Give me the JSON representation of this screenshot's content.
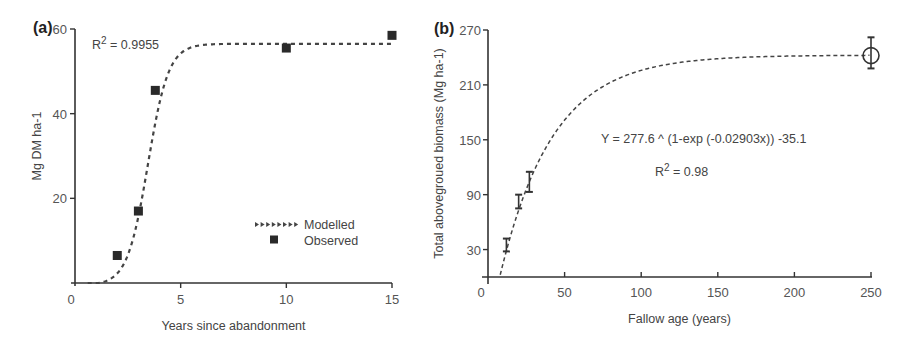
{
  "chart_data": [
    {
      "panel": "(a)",
      "type": "scatter",
      "title": "",
      "xlabel": "Years since abandonment",
      "ylabel": "Mg DM ha-1",
      "xlim": [
        0,
        15
      ],
      "ylim": [
        0,
        60
      ],
      "x_ticks": [
        "0",
        "5",
        "10",
        "15"
      ],
      "y_ticks": [
        "20",
        "40",
        "60"
      ],
      "grid": false,
      "legend_position": "lower right",
      "annotation": "R2 = 0.9955",
      "annotation_main": "R",
      "annotation_sup": "2",
      "annotation_rest": " = 0.9955",
      "series": [
        {
          "name": "Modelled",
          "style": "dashed line with arrow markers",
          "x": [
            0.5,
            1,
            1.5,
            2,
            2.5,
            3,
            3.5,
            4,
            4.5,
            5,
            5.5,
            6,
            8,
            10,
            12,
            15
          ],
          "y": [
            0,
            0.8,
            2.5,
            5.5,
            11,
            19,
            30,
            41,
            50,
            55,
            56.5,
            57,
            57,
            57,
            57,
            57
          ]
        },
        {
          "name": "Observed",
          "style": "filled square",
          "x": [
            2,
            3,
            3.8,
            10,
            15
          ],
          "y": [
            6.5,
            17,
            45.5,
            55.5,
            58.5
          ]
        }
      ],
      "legend": [
        "Modelled",
        "Observed"
      ]
    },
    {
      "panel": "(b)",
      "type": "scatter",
      "title": "",
      "xlabel": "Fallow age (years)",
      "ylabel": "Total abovegroued biomass (Mg ha-1)",
      "xlim": [
        0,
        250
      ],
      "ylim": [
        0,
        270
      ],
      "x_ticks": [
        "0",
        "50",
        "100",
        "150",
        "200",
        "250"
      ],
      "y_ticks": [
        "30",
        "90",
        "150",
        "210",
        "270"
      ],
      "grid": false,
      "equation": "Y = 277.6 ^ (1-exp (-0.02903x)) -35.1",
      "r2_main": "R",
      "r2_sup": "2",
      "r2_rest": " = 0.98",
      "series": [
        {
          "name": "Fitted curve",
          "style": "dashed line",
          "formula": "Y = 277.6*(1-exp(-0.02903x)) - 35.1"
        },
        {
          "name": "Observed (mean ± error)",
          "style": "error bars",
          "x": [
            12,
            20,
            27,
            250
          ],
          "y": [
            35,
            82,
            104,
            242
          ],
          "y_low": [
            28,
            75,
            93,
            228
          ],
          "y_high": [
            42,
            90,
            115,
            262
          ],
          "marker": [
            "none",
            "none",
            "none",
            "open circle"
          ]
        }
      ]
    }
  ]
}
